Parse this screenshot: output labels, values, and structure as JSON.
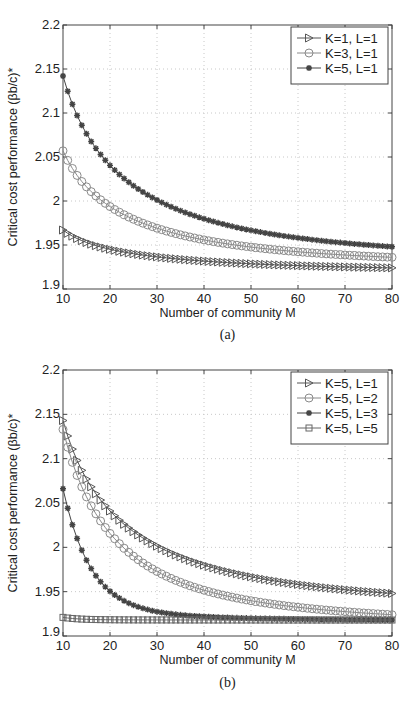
{
  "chart_data": [
    {
      "type": "line",
      "panel_label": "(a)",
      "xlabel": "Number of community M",
      "ylabel": "Critical cost performance (βb/c)*",
      "xlim": [
        10,
        80
      ],
      "ylim": [
        1.9,
        2.2
      ],
      "xticks": [
        "10",
        "20",
        "30",
        "40",
        "50",
        "60",
        "70",
        "80"
      ],
      "yticks": [
        "1.9",
        "1.95",
        "2",
        "2.05",
        "2.1",
        "2.15",
        "2.2"
      ],
      "grid": true,
      "legend_position": "top-right",
      "series": [
        {
          "name": "K=1, L=1",
          "marker": "triangle-right",
          "color": "#555555",
          "x_range": [
            10,
            80
          ],
          "start": 1.967,
          "end": 1.924,
          "decay": 0.035
        },
        {
          "name": "K=3, L=1",
          "marker": "circle",
          "color": "#8a8a8a",
          "x_range": [
            10,
            80
          ],
          "start": 2.057,
          "end": 1.936,
          "decay": 0.045
        },
        {
          "name": "K=5, L=1",
          "marker": "star",
          "color": "#444444",
          "x_range": [
            10,
            80
          ],
          "start": 2.142,
          "end": 1.948,
          "decay": 0.045
        }
      ]
    },
    {
      "type": "line",
      "panel_label": "(b)",
      "xlabel": "Number of community M",
      "ylabel": "Critical cost performance (βb/c)*",
      "xlim": [
        10,
        80
      ],
      "ylim": [
        1.9,
        2.2
      ],
      "xticks": [
        "10",
        "20",
        "30",
        "40",
        "50",
        "60",
        "70",
        "80"
      ],
      "yticks": [
        "1.9",
        "1.95",
        "2",
        "2.05",
        "2.1",
        "2.15",
        "2.2"
      ],
      "grid": true,
      "legend_position": "top-right",
      "series": [
        {
          "name": "K=5, L=1",
          "marker": "triangle-right",
          "color": "#555555",
          "x_range": [
            10,
            80
          ],
          "start": 2.143,
          "end": 1.948,
          "decay": 0.045
        },
        {
          "name": "K=5, L=2",
          "marker": "circle",
          "color": "#8a8a8a",
          "x_range": [
            10,
            80
          ],
          "start": 2.133,
          "end": 1.924,
          "decay": 0.075
        },
        {
          "name": "K=5, L=3",
          "marker": "star",
          "color": "#444444",
          "x_range": [
            10,
            80
          ],
          "start": 2.066,
          "end": 1.918,
          "decay": 0.17
        },
        {
          "name": "K=5, L=5",
          "marker": "square",
          "color": "#666666",
          "x_range": [
            10,
            80
          ],
          "start": 1.921,
          "end": 1.918,
          "decay": 0.3
        }
      ]
    }
  ]
}
